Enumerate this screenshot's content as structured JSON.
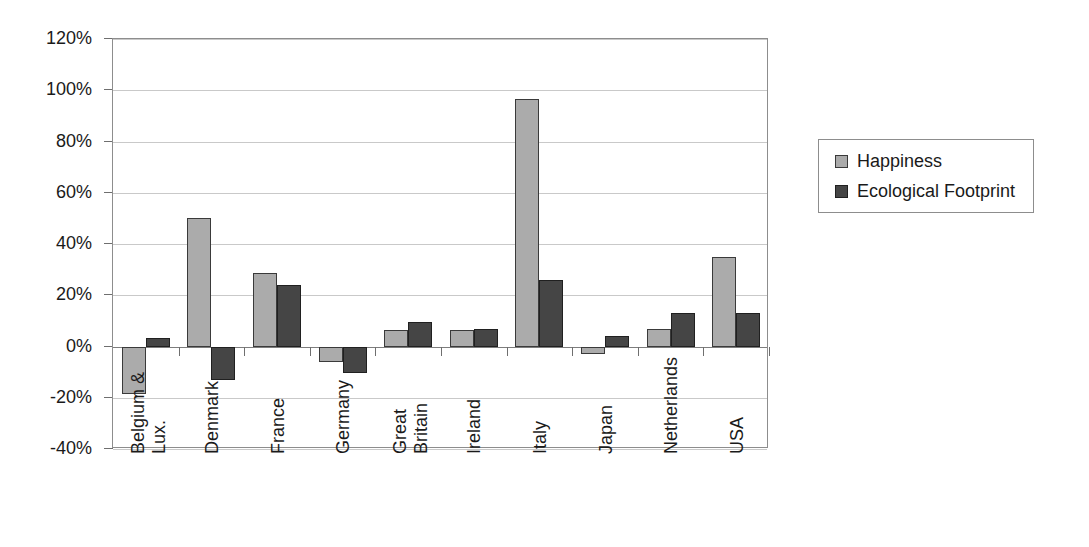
{
  "chart_data": {
    "type": "bar",
    "title": "",
    "subtitle": "",
    "xlabel": "",
    "ylabel": "",
    "grid": true,
    "legend_position": "right",
    "ylim": [
      -40,
      120
    ],
    "ytick_labels": [
      "120%",
      "100%",
      "80%",
      "60%",
      "40%",
      "20%",
      "0%",
      "-20%",
      "-40%"
    ],
    "ytick_values": [
      120,
      100,
      80,
      60,
      40,
      20,
      0,
      -20,
      -40
    ],
    "categories": [
      "Belgium & Lux.",
      "Denmark",
      "France",
      "Germany",
      "Great Britain",
      "Ireland",
      "Italy",
      "Japan",
      "Netherlands",
      "USA"
    ],
    "category_lines": [
      [
        "Belgium &",
        "Lux."
      ],
      [
        "Denmark"
      ],
      [
        "France"
      ],
      [
        "Germany"
      ],
      [
        "Great",
        "Britain"
      ],
      [
        "Ireland"
      ],
      [
        "Italy"
      ],
      [
        "Japan"
      ],
      [
        "Netherlands"
      ],
      [
        "USA"
      ]
    ],
    "series": [
      {
        "name": "Happiness",
        "color": "#ababab",
        "values": [
          -18.5,
          50.0,
          28.5,
          -6.0,
          6.5,
          6.5,
          96.5,
          -3.0,
          7.0,
          35.0
        ]
      },
      {
        "name": "Ecological Footprint",
        "color": "#454545",
        "values": [
          3.5,
          -13.0,
          24.0,
          -10.5,
          9.5,
          7.0,
          26.0,
          4.0,
          13.0,
          13.0
        ]
      }
    ]
  },
  "legend": {
    "items": [
      {
        "label": "Happiness",
        "swatch": "happiness"
      },
      {
        "label": "Ecological Footprint",
        "swatch": "eco"
      }
    ]
  }
}
